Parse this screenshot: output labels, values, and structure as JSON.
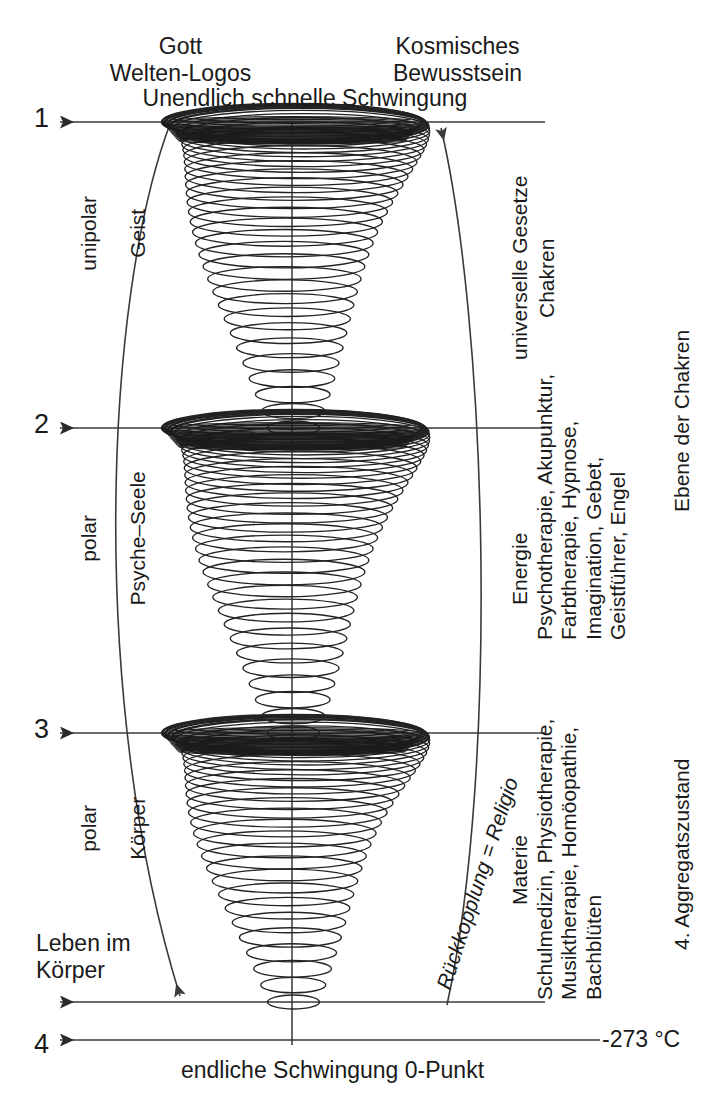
{
  "diagram": {
    "title": "Unendlich schnelle Schwingung",
    "top_left_label": "Gott\nWelten-Logos",
    "top_right_label": "Kosmisches\nBewusstsein",
    "bottom_caption": "endliche Schwingung 0-Punkt",
    "temperature_label": "-273 °C",
    "leben_label": "Leben im\nKörper",
    "feedback_label": "Rückkopplung = Religio",
    "level_markers": [
      "1",
      "2",
      "3",
      "4"
    ],
    "left_sections": [
      {
        "line1": "unipolar",
        "line2": "Geist"
      },
      {
        "line1": "polar",
        "line2": "Psyche–Seele"
      },
      {
        "line1": "polar",
        "line2": "Körper"
      }
    ],
    "right_sections": [
      {
        "name": "universelle Gesetze",
        "detail": "Chakren"
      },
      {
        "name": "Energie",
        "detail": "Psychotherapie, Akupunktur,\nFarbtherapie, Hypnose,\nImagination, Gebet,\nGeistführer, Engel"
      },
      {
        "name": "Materie",
        "detail": "Schulmedizin, Physiotherapie,\nMusiktherapie, Homöopathie,\nBachblüten"
      }
    ],
    "outer_right_labels": [
      "Ebene der Chakren",
      "4. Aggregatszustand"
    ],
    "colors": {
      "ink": "#1a1a1a",
      "line": "#3a3a3a",
      "background": "#ffffff"
    }
  },
  "chart_data": {
    "type": "diagram",
    "title": "Unendlich schnelle Schwingung",
    "levels": [
      {
        "marker": "1",
        "y": 122,
        "caption": "Unendlich schnelle Schwingung"
      },
      {
        "marker": "2",
        "y": 428,
        "caption": ""
      },
      {
        "marker": "3",
        "y": 733,
        "caption": ""
      },
      {
        "marker": "4",
        "y": 1040,
        "caption": "endliche Schwingung 0-Punkt"
      }
    ],
    "cones": [
      {
        "index": 1,
        "top_y": 122,
        "bottom_y": 428,
        "top_half_width": 130,
        "bottom_half_width": 26,
        "turns": 34,
        "realm": "unipolar / Geist"
      },
      {
        "index": 2,
        "top_y": 428,
        "bottom_y": 733,
        "top_half_width": 130,
        "bottom_half_width": 26,
        "turns": 34,
        "realm": "polar / Psyche–Seele"
      },
      {
        "index": 3,
        "top_y": 733,
        "bottom_y": 1002,
        "top_half_width": 130,
        "bottom_half_width": 26,
        "turns": 30,
        "realm": "polar / Körper"
      }
    ],
    "axis_x": 292,
    "xlabel": "",
    "ylabel": "Schwingungsfrequenz",
    "grid": false
  }
}
